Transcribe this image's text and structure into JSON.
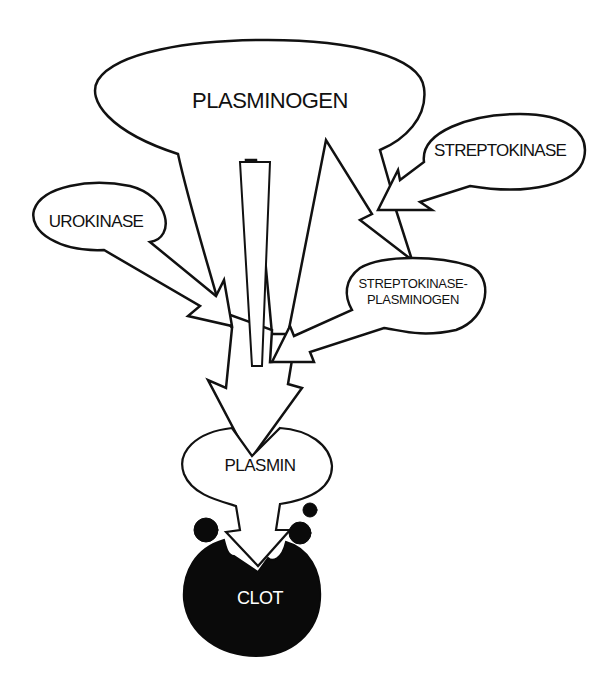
{
  "diagram": {
    "nodes": {
      "plasminogen": {
        "label": "PLASMINOGEN"
      },
      "streptokinase": {
        "label": "STREPTOKINASE"
      },
      "urokinase": {
        "label": "UROKINASE"
      },
      "streptokinase_plasminogen": {
        "line1": "STREPTOKINASE-",
        "line2": "PLASMINOGEN"
      },
      "plasmin": {
        "label": "PLASMIN"
      },
      "clot": {
        "label": "CLOT"
      }
    },
    "edges": [
      {
        "from": "plasminogen",
        "to": "plasmin"
      },
      {
        "from": "plasminogen",
        "to": "streptokinase_plasminogen"
      },
      {
        "from": "streptokinase",
        "to": "streptokinase_plasminogen"
      },
      {
        "from": "urokinase",
        "to": "plasmin"
      },
      {
        "from": "streptokinase_plasminogen",
        "to": "plasmin"
      },
      {
        "from": "plasmin",
        "to": "clot"
      }
    ],
    "colors": {
      "background": "#ffffff",
      "stroke": "#111111",
      "clot_fill": "#0a0a0a",
      "clot_text": "#ffffff"
    }
  }
}
